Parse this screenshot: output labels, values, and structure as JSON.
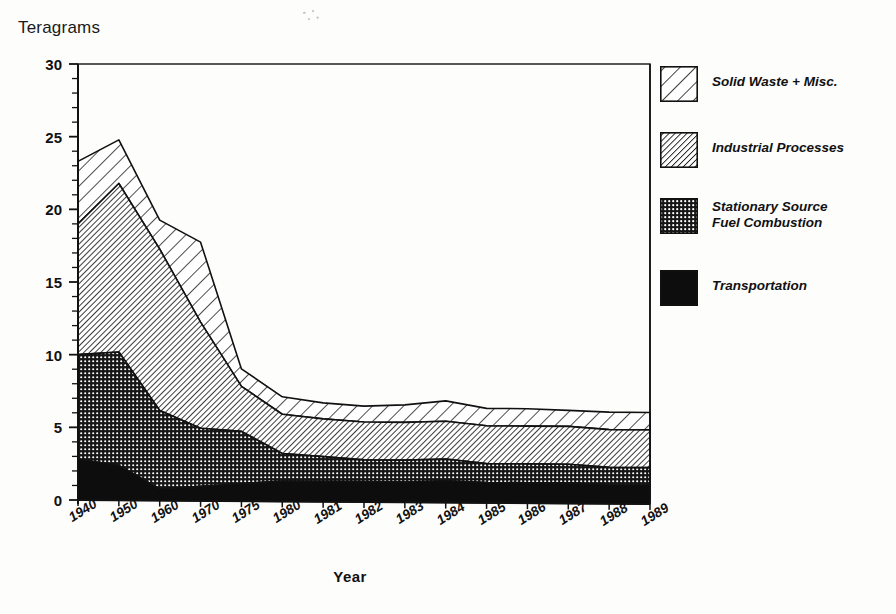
{
  "axes": {
    "y_title": "Teragrams",
    "x_title": "Year",
    "y_ticks": [
      "0",
      "5",
      "10",
      "15",
      "20",
      "25",
      "30"
    ],
    "x_ticks": [
      "1940",
      "1950",
      "1960",
      "1970",
      "1975",
      "1980",
      "1981",
      "1982",
      "1983",
      "1984",
      "1985",
      "1986",
      "1987",
      "1988",
      "1989"
    ]
  },
  "legend": {
    "items": [
      {
        "label": "Solid Waste + Misc.",
        "pattern": "diagonal-wide-hatch",
        "swatch_name": "legend-swatch-solid-waste"
      },
      {
        "label": "Industrial Processes",
        "pattern": "diagonal-fine-hatch",
        "swatch_name": "legend-swatch-industrial-processes"
      },
      {
        "label": "Stationary Source\nFuel Combustion",
        "pattern": "dotted-grid",
        "swatch_name": "legend-swatch-stationary-source"
      },
      {
        "label": "Transportation",
        "pattern": "solid-black",
        "swatch_name": "legend-swatch-transportation"
      }
    ]
  },
  "colors": {
    "axis": "#111111",
    "transportation": "#0d0d0d",
    "stationary": "#6e6e6e",
    "industrial": "#bdbdbd",
    "solid_waste": "#ffffff",
    "background": "#fdfdfc"
  },
  "chart_data": {
    "type": "area",
    "stacked": true,
    "title": "",
    "xlabel": "Year",
    "ylabel": "Teragrams",
    "ylim": [
      0,
      30
    ],
    "ytick_step": 5,
    "minor_ytick_step": 1,
    "grid": false,
    "legend_position": "right",
    "categories": [
      "1940",
      "1950",
      "1960",
      "1970",
      "1975",
      "1980",
      "1981",
      "1982",
      "1983",
      "1984",
      "1985",
      "1986",
      "1987",
      "1988",
      "1989"
    ],
    "series": [
      {
        "name": "Transportation",
        "values": [
          2.8,
          2.4,
          0.8,
          1.0,
          1.2,
          1.4,
          1.4,
          1.4,
          1.4,
          1.5,
          1.4,
          1.4,
          1.4,
          1.3,
          1.3
        ]
      },
      {
        "name": "Stationary Source Fuel Combustion",
        "values": [
          7.2,
          7.8,
          5.4,
          4.0,
          3.6,
          1.9,
          1.7,
          1.5,
          1.5,
          1.5,
          1.3,
          1.3,
          1.3,
          1.2,
          1.2
        ]
      },
      {
        "name": "Industrial Processes",
        "values": [
          9.0,
          11.6,
          11.1,
          7.3,
          3.1,
          2.7,
          2.6,
          2.6,
          2.6,
          2.6,
          2.6,
          2.6,
          2.6,
          2.6,
          2.6
        ]
      },
      {
        "name": "Solid Waste + Misc.",
        "values": [
          4.3,
          3.0,
          2.0,
          5.5,
          1.2,
          1.2,
          1.1,
          1.1,
          1.2,
          1.4,
          1.2,
          1.2,
          1.1,
          1.2,
          1.2
        ]
      }
    ],
    "cumulative_tops": {
      "transportation": [
        2.8,
        2.4,
        0.8,
        1.0,
        1.2,
        1.4,
        1.4,
        1.4,
        1.4,
        1.5,
        1.4,
        1.4,
        1.4,
        1.3,
        1.3
      ],
      "stationary": [
        10.0,
        10.2,
        6.2,
        5.0,
        4.8,
        3.3,
        3.1,
        2.9,
        2.9,
        3.0,
        2.7,
        2.7,
        2.7,
        2.5,
        2.5
      ],
      "industrial": [
        19.0,
        21.8,
        17.3,
        12.3,
        7.9,
        6.0,
        5.7,
        5.5,
        5.5,
        5.6,
        5.3,
        5.3,
        5.3,
        5.1,
        5.1
      ],
      "total": [
        23.3,
        24.8,
        19.3,
        17.8,
        9.1,
        7.2,
        6.8,
        6.6,
        6.7,
        7.0,
        6.5,
        6.5,
        6.4,
        6.3,
        6.3
      ]
    }
  },
  "plot_geometry": {
    "left_px": 78,
    "right_px": 650,
    "top_px": 64,
    "bottom_px": 500
  }
}
